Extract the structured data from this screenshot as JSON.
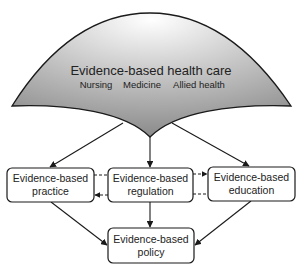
{
  "diagram": {
    "type": "flow",
    "colors": {
      "stroke": "#1a1a1a",
      "shape_fill_light": "#f4f4f4",
      "shape_fill_dark": "#8a8a8a",
      "box_fill": "#ffffff",
      "text": "#222222"
    },
    "top_shape": {
      "title": "Evidence-based health care",
      "disciplines": [
        "Nursing",
        "Medicine",
        "Allied health"
      ]
    },
    "nodes": [
      {
        "id": "practice",
        "line1": "Evidence-based",
        "line2": "practice"
      },
      {
        "id": "regulation",
        "line1": "Evidence-based",
        "line2": "regulation"
      },
      {
        "id": "education",
        "line1": "Evidence-based",
        "line2": "education"
      },
      {
        "id": "policy",
        "line1": "Evidence-based",
        "line2": "policy"
      }
    ],
    "edges": [
      {
        "from": "health-care",
        "to": "practice",
        "style": "solid"
      },
      {
        "from": "health-care",
        "to": "regulation",
        "style": "solid"
      },
      {
        "from": "health-care",
        "to": "education",
        "style": "solid"
      },
      {
        "from": "regulation",
        "to": "practice",
        "style": "dashed"
      },
      {
        "from": "regulation",
        "to": "education",
        "style": "dashed"
      },
      {
        "from": "practice",
        "to": "policy",
        "style": "solid"
      },
      {
        "from": "regulation",
        "to": "policy",
        "style": "solid"
      },
      {
        "from": "education",
        "to": "policy",
        "style": "solid"
      }
    ]
  }
}
